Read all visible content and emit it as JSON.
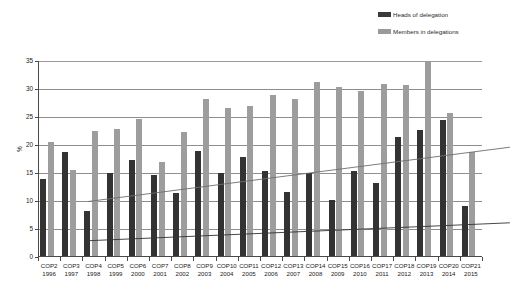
{
  "legend": {
    "items": [
      {
        "label": "Heads of delegation",
        "color": "#333333",
        "key": "heads"
      },
      {
        "label": "Members in delegations",
        "color": "#9d9d9d",
        "key": "members"
      }
    ]
  },
  "chart_data": {
    "type": "bar",
    "title": "",
    "xlabel": "",
    "ylabel": "%",
    "ylim": [
      0,
      35
    ],
    "ytick_step": 5,
    "yticks": [
      "0",
      "5",
      "10",
      "15",
      "20",
      "25",
      "30",
      "35"
    ],
    "grid": true,
    "legend_position": "top-right",
    "categories": [
      "COP2",
      "COP3",
      "COP4",
      "COP5",
      "COP6",
      "COP7",
      "COP8",
      "COP9",
      "COP10",
      "COP11",
      "COP12",
      "COP13",
      "COP14",
      "COP15",
      "COP16",
      "COP17",
      "COP18",
      "COP19",
      "COP20",
      "COP21"
    ],
    "category_years": [
      "1996",
      "1997",
      "1998",
      "1999",
      "2000",
      "2001",
      "2002",
      "2003",
      "2004",
      "2005",
      "2006",
      "2007",
      "2008",
      "2009",
      "2010",
      "2011",
      "2012",
      "2013",
      "2014",
      "2015"
    ],
    "series": [
      {
        "name": "Heads of delegation",
        "color": "#333333",
        "values": [
          13.7,
          18.6,
          8.0,
          14.9,
          17.1,
          14.5,
          11.2,
          18.7,
          14.8,
          17.6,
          15.2,
          11.5,
          14.9,
          10.0,
          15.1,
          13.1,
          21.3,
          22.5,
          24.3,
          8.9
        ]
      },
      {
        "name": "Members in delegations",
        "color": "#9d9d9d",
        "values": [
          20.4,
          15.3,
          22.4,
          22.6,
          24.5,
          16.8,
          22.1,
          28.0,
          26.5,
          26.7,
          28.8,
          28.1,
          31.1,
          30.2,
          29.5,
          30.7,
          30.6,
          34.7,
          25.5,
          18.5
        ]
      }
    ],
    "trendlines": [
      {
        "name": "Members in delegations trend",
        "color": "#6e6e6e",
        "start": 20.8,
        "end": 30.5
      },
      {
        "name": "Heads of delegation trend",
        "color": "#333333",
        "start": 13.8,
        "end": 17.0
      }
    ]
  }
}
